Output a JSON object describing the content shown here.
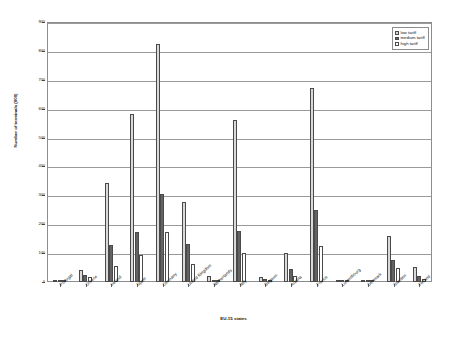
{
  "chart_data": {
    "type": "bar",
    "title": "",
    "xlabel": "EU-15 states",
    "ylabel": "Number of terminals (000)",
    "ylim": [
      0,
      900
    ],
    "ytick_step": 100,
    "yticks": [
      "0",
      "100",
      "200",
      "300",
      "400",
      "500",
      "600",
      "700",
      "800",
      "900"
    ],
    "grid": true,
    "legend_position": "top-right",
    "categories": [
      "Portugal",
      "Greece",
      "Ireland",
      "Spain",
      "Germany",
      "United Kingdom",
      "Netherlands",
      "Italy",
      "Belgium",
      "Austria",
      "France",
      "Luxembourg",
      "Denmark",
      "Sweden",
      "Finland"
    ],
    "series": [
      {
        "name": "low tariff",
        "color": "#d9d9d9",
        "values": [
          4,
          42,
          343,
          580,
          825,
          277,
          22,
          562,
          18,
          100,
          670,
          2,
          2,
          158,
          52
        ]
      },
      {
        "name": "medium tariff",
        "color": "#636363",
        "values": [
          2,
          25,
          128,
          172,
          305,
          130,
          6,
          175,
          9,
          45,
          248,
          1,
          1,
          75,
          20
        ]
      },
      {
        "name": "high tariff",
        "color": "#ffffff",
        "values": [
          1,
          18,
          57,
          95,
          172,
          63,
          3,
          100,
          6,
          20,
          123,
          1,
          1,
          48,
          10
        ]
      }
    ]
  },
  "legend": {
    "items": [
      {
        "label": "low tariff",
        "key": "low"
      },
      {
        "label": "medium tariff",
        "key": "medium"
      },
      {
        "label": "high tariff",
        "key": "high"
      }
    ]
  }
}
